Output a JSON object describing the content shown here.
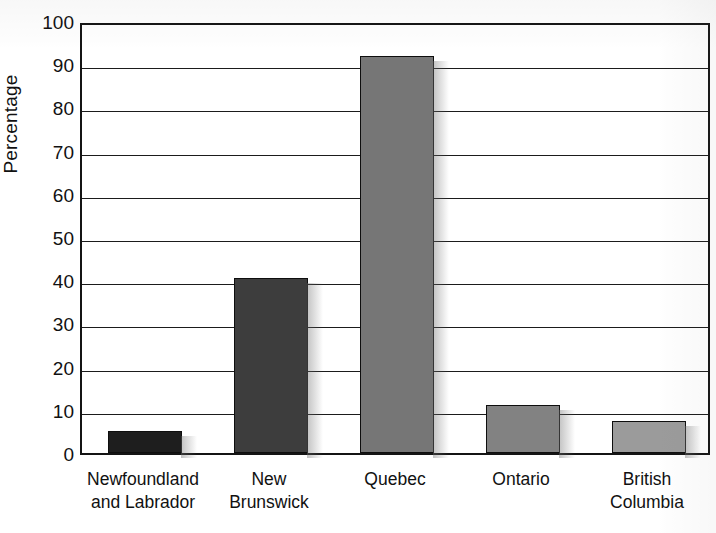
{
  "chart_data": {
    "type": "bar",
    "title": "",
    "xlabel": "",
    "ylabel": "Percentage",
    "ylim": [
      0,
      100
    ],
    "grid": true,
    "legend": "none",
    "categories": [
      "Newfoundland and Labrador",
      "New Brunswick",
      "Quebec",
      "Ontario",
      "British Columbia"
    ],
    "category_lines": [
      [
        "Newfoundland",
        "and Labrador"
      ],
      [
        "New",
        "Brunswick"
      ],
      [
        "Quebec"
      ],
      [
        "Ontario"
      ],
      [
        "British",
        "Columbia"
      ]
    ],
    "values": [
      5,
      40.5,
      92,
      11,
      7.5
    ],
    "bar_colors": [
      "#1e1e1e",
      "#3d3d3d",
      "#767676",
      "#828282",
      "#9b9b9b"
    ],
    "y_ticks": [
      0,
      10,
      20,
      30,
      40,
      50,
      60,
      70,
      80,
      90,
      100
    ],
    "y_tick_labels": [
      "0",
      "10",
      "20",
      "30",
      "40",
      "50",
      "60",
      "70",
      "80",
      "90",
      "100"
    ],
    "axis_color": "#141414",
    "gridline_color": "#1b1b1b",
    "background_color": "#ffffff"
  }
}
